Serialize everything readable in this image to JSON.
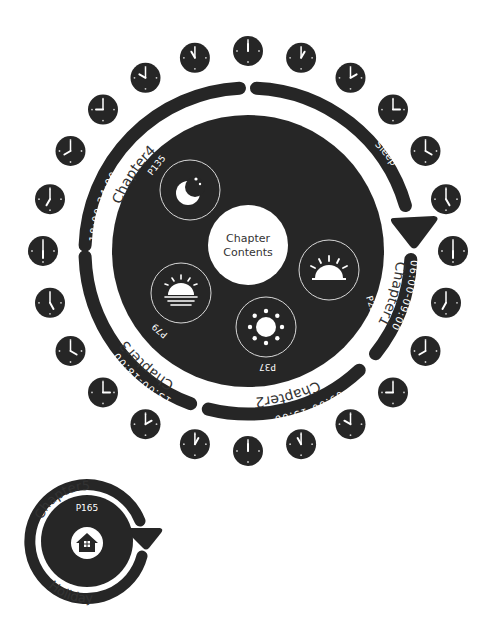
{
  "colors": {
    "ink": "#262626",
    "paper": "#ffffff",
    "line": "#d8d8d8"
  },
  "center": {
    "title_line1": "Chapter",
    "title_line2": "Contents"
  },
  "segments": [
    {
      "id": "sleep",
      "label": "Sleep",
      "time": "",
      "page": "",
      "icon": ""
    },
    {
      "id": "chapter1",
      "label": "Chapter1",
      "time": "06:00-09:00",
      "page": "P23",
      "icon": "sunrise-icon"
    },
    {
      "id": "chapter2",
      "label": "Chapter2",
      "time": "09:00-13:00",
      "page": "P37",
      "icon": "sun-icon"
    },
    {
      "id": "chapter3",
      "label": "Chapter3",
      "time": "13:00-18:00",
      "page": "P79",
      "icon": "sunset-icon"
    },
    {
      "id": "chapter4",
      "label": "Chapter4",
      "time": "18:00-24:00",
      "page": "P135",
      "icon": "moon-icon"
    }
  ],
  "clocks": {
    "count": 24,
    "hours": [
      12,
      1,
      2,
      3,
      4,
      5,
      6,
      7,
      8,
      9,
      10,
      11,
      12,
      1,
      2,
      3,
      4,
      5,
      6,
      7,
      8,
      9,
      10,
      11
    ]
  },
  "holiday": {
    "label": "Chapter5",
    "page": "P165",
    "caption": "Holiday",
    "icon": "house-icon"
  }
}
